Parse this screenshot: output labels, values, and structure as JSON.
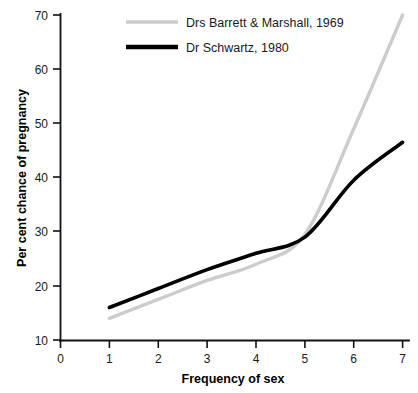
{
  "chart_data": {
    "type": "line",
    "title": "",
    "xlabel": "Frequency of sex",
    "ylabel": "Per cent chance of pregnancy",
    "xlim": [
      0,
      7
    ],
    "ylim": [
      10,
      70
    ],
    "xticks": [
      "0",
      "1",
      "2",
      "3",
      "4",
      "5",
      "6",
      "7"
    ],
    "yticks": [
      "10",
      "20",
      "30",
      "40",
      "50",
      "60",
      "70"
    ],
    "grid": false,
    "legend_position": "top-center",
    "x": [
      1,
      2,
      3,
      4,
      5,
      6,
      7
    ],
    "series": [
      {
        "name": "Drs Barrett & Marshall, 1969",
        "color": "#cccccc",
        "values": [
          14,
          17.5,
          21,
          24,
          29.5,
          49,
          70
        ]
      },
      {
        "name": "Dr Schwartz, 1980",
        "color": "#000000",
        "values": [
          16,
          19.5,
          23,
          26,
          29,
          39.5,
          46.5
        ]
      }
    ]
  },
  "axes": {
    "x_title": "Frequency of sex",
    "y_title": "Per cent chance of pregnancy",
    "x_tick_labels": [
      "0",
      "1",
      "2",
      "3",
      "4",
      "5",
      "6",
      "7"
    ],
    "y_tick_labels": [
      "10",
      "20",
      "30",
      "40",
      "50",
      "60",
      "70"
    ]
  },
  "legend": {
    "items": [
      {
        "label": "Drs Barrett & Marshall, 1969",
        "color": "#cccccc"
      },
      {
        "label": "Dr Schwartz, 1980",
        "color": "#000000"
      }
    ]
  },
  "colors": {
    "background": "#ffffff",
    "axis": "#111111",
    "series_gray": "#cccccc",
    "series_black": "#000000"
  }
}
